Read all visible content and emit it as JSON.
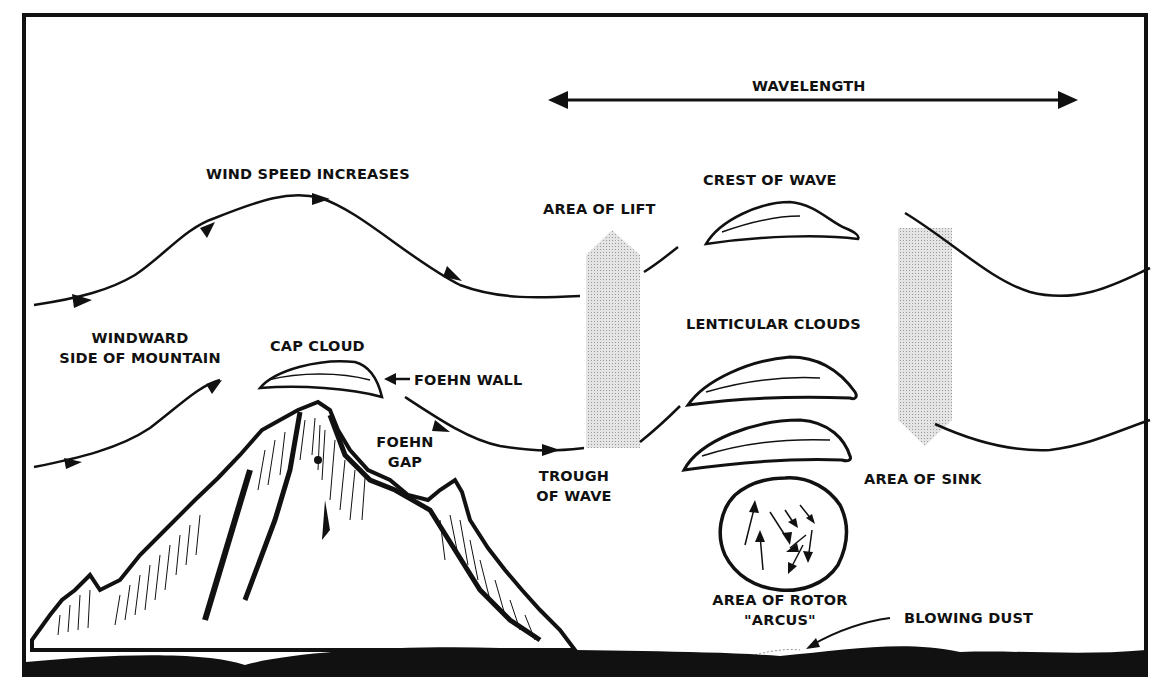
{
  "diagram": {
    "colors": {
      "ink": "#111111",
      "shade": "#d6d6d6",
      "background": "#ffffff",
      "ground": "#111111"
    },
    "labels": {
      "wavelength": "WAVELENGTH",
      "wind_speed_increases": "WIND SPEED INCREASES",
      "area_of_lift": "AREA OF LIFT",
      "crest_of_wave": "CREST OF WAVE",
      "windward_line1": "WINDWARD",
      "windward_line2": "SIDE OF MOUNTAIN",
      "cap_cloud": "CAP CLOUD",
      "foehn_wall": "FOEHN WALL",
      "lenticular_clouds": "LENTICULAR CLOUDS",
      "foehn_gap_line1": "FOEHN",
      "foehn_gap_line2": "GAP",
      "trough_line1": "TROUGH",
      "trough_line2": "OF WAVE",
      "area_of_sink": "AREA OF SINK",
      "rotor_line1": "AREA OF ROTOR",
      "rotor_line2": "\"ARCUS\"",
      "blowing_dust": "BLOWING DUST"
    }
  }
}
